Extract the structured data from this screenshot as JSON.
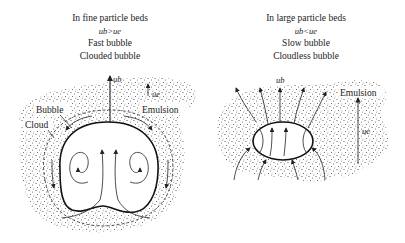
{
  "left_panel": {
    "title": "In fine particle beds",
    "condition": "u_b>u_e",
    "condition_display": "ub>ue",
    "type": "Fast bubble",
    "subtype": "Clouded bubble",
    "labels": {
      "bubble": "Bubble",
      "cloud": "Cloud",
      "emulsion": "Emulsion",
      "ub": "ub",
      "ue": "ue"
    }
  },
  "right_panel": {
    "title": "In large particle beds",
    "condition": "u_b<u_e",
    "condition_display": "ub<ue",
    "type": "Slow bubble",
    "subtype": "Cloudless bubble",
    "labels": {
      "emulsion": "Emulsion",
      "ub": "ub",
      "ue": "ue"
    }
  }
}
